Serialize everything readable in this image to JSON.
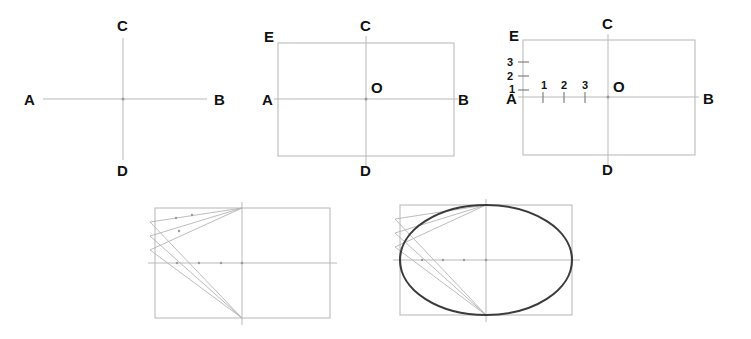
{
  "figure": {
    "background_color": "#ffffff",
    "ink_color": "#111111",
    "construction_line_color": "#b0b0b0",
    "rect_outline_color": "#b5b5b5",
    "axis_line_color": "#b9b9b9",
    "ellipse_color": "#3b3b3b",
    "panel_count": 5
  },
  "panels": [
    {
      "id": "panel-1",
      "step": "1",
      "description": "Draw major axis AB and minor axis CD crossing at the centre",
      "labels": {
        "left": "A",
        "right": "B",
        "top": "C",
        "bottom": "D"
      },
      "geometry": {
        "center_x": 123,
        "center_y": 99,
        "h_line_x1": 43,
        "h_line_x2": 207,
        "v_line_y1": 38,
        "v_line_y2": 160
      },
      "label_positions": {
        "A": {
          "x": 24,
          "y": 105
        },
        "B": {
          "x": 214,
          "y": 105
        },
        "C": {
          "x": 117,
          "y": 31
        },
        "D": {
          "x": 117,
          "y": 176
        }
      }
    },
    {
      "id": "panel-2",
      "step": "2",
      "description": "Complete the enclosing rectangle about the axes; mark centre O and corner E",
      "labels": {
        "left": "A",
        "right": "B",
        "top": "C",
        "bottom": "D",
        "center": "O",
        "corner": "E"
      },
      "geometry": {
        "rect_x": 278,
        "rect_y": 43,
        "rect_w": 176,
        "rect_h": 113,
        "center_x": 366,
        "center_y": 99
      },
      "label_positions": {
        "A": {
          "x": 262,
          "y": 105
        },
        "B": {
          "x": 458,
          "y": 105
        },
        "C": {
          "x": 360,
          "y": 31
        },
        "D": {
          "x": 360,
          "y": 176
        },
        "O": {
          "x": 371,
          "y": 93
        },
        "E": {
          "x": 264,
          "y": 42
        }
      }
    },
    {
      "id": "panel-3",
      "step": "3",
      "description": "Divide AE and AO into the same number of equal parts and number them 1, 2, 3",
      "labels": {
        "left": "A",
        "right": "B",
        "top": "C",
        "bottom": "D",
        "center": "O",
        "corner": "E"
      },
      "division_count": 3,
      "vertical_tick_labels": [
        "3",
        "2",
        "1"
      ],
      "horizontal_tick_labels": [
        "1",
        "2",
        "3"
      ],
      "geometry": {
        "rect_x": 523,
        "rect_y": 40,
        "rect_w": 172,
        "rect_h": 115,
        "center_x": 608,
        "center_y": 97
      },
      "vertical_ticks_y": [
        62,
        76,
        90
      ],
      "horizontal_ticks_x": [
        543,
        564,
        585
      ],
      "label_positions": {
        "A": {
          "x": 506,
          "y": 104
        },
        "B": {
          "x": 703,
          "y": 104
        },
        "C": {
          "x": 602,
          "y": 29
        },
        "D": {
          "x": 602,
          "y": 175
        },
        "O": {
          "x": 613,
          "y": 92
        },
        "E": {
          "x": 509,
          "y": 41
        }
      }
    },
    {
      "id": "panel-4",
      "step": "4",
      "description": "Draw rays from C through the divisions on AE and from D through the divisions on AO; their crossings give points on the curve",
      "geometry": {
        "rect_x": 155,
        "rect_y": 208,
        "rect_w": 175,
        "rect_h": 110,
        "center_x": 242,
        "center_y": 263
      },
      "ray_origin_top": {
        "x": 242,
        "y": 208
      },
      "ray_origin_bottom": {
        "x": 242,
        "y": 318
      },
      "left_edge_targets_y": [
        222,
        236,
        250
      ],
      "axis_targets_x": [
        177,
        199,
        221
      ],
      "labels": {}
    },
    {
      "id": "panel-5",
      "step": "5",
      "description": "Join the located points with a smooth curve to complete the ellipse",
      "geometry": {
        "rect_x": 400,
        "rect_y": 205,
        "rect_w": 172,
        "rect_h": 110,
        "center_x": 486,
        "center_y": 260,
        "ellipse_rx": 86,
        "ellipse_ry": 55
      },
      "ray_origin_top": {
        "x": 486,
        "y": 205
      },
      "ray_origin_bottom": {
        "x": 486,
        "y": 315
      },
      "left_edge_targets_y": [
        219,
        233,
        247
      ],
      "axis_targets_x": [
        422,
        443,
        464
      ],
      "labels": {}
    }
  ]
}
